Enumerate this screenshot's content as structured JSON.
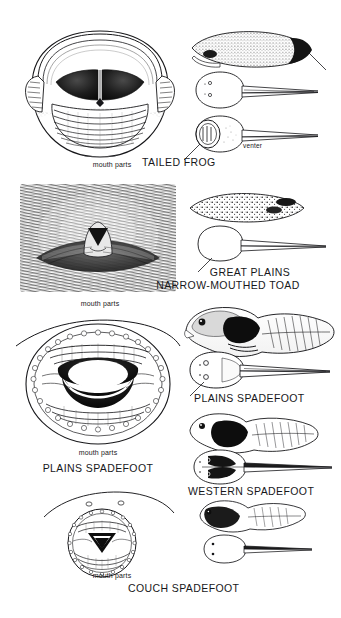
{
  "plate": {
    "kind": "field-guide-illustration-plate",
    "subject": "tadpole mouth parts and body forms",
    "background_color": "#ffffff",
    "ink_color": "#17171a",
    "width": 341,
    "height": 618
  },
  "groups": [
    {
      "id": "tailed-frog",
      "common_name": "TAILED FROG",
      "mouthparts_label": "mouth parts",
      "annotations": [
        "venter"
      ],
      "mouthparts_caption_x": 112,
      "mouthparts_caption_y": 168,
      "name_label_x": 142,
      "name_label_y": 163,
      "views": [
        "lateral",
        "dorsal",
        "ventral"
      ],
      "mouth_description": "very large suctorial oral disc, upper lip hood, two dark jaw sheaths, many transverse tooth rows"
    },
    {
      "id": "great-plains-narrow-mouthed-toad",
      "common_name_line1": "GREAT PLAINS",
      "common_name_line2": "NARROW-MOUTHED TOAD",
      "mouthparts_label": "mouth parts",
      "annotations": [],
      "mouthparts_caption_x": 100,
      "mouthparts_caption_y": 306,
      "name_label_x": 250,
      "name_label_y": 273,
      "views": [
        "lateral",
        "dorsal"
      ],
      "mouth_description": "no oral disc or teeth; small transverse slit mouth in dense stippled field"
    },
    {
      "id": "plains-spadefoot",
      "common_name": "PLAINS SPADEFOOT",
      "mouthparts_label": "mouth parts",
      "annotations": [],
      "mouthparts_caption_x": 98,
      "mouthparts_caption_y": 455,
      "name_label_x": 98,
      "name_label_y": 470,
      "right_name_label": "PLAINS SPADEFOOT",
      "right_name_label_x": 255,
      "right_name_label_y": 399,
      "views": [
        "lateral",
        "dorsal"
      ],
      "mouth_description": "round oral disc ringed by marginal papillae, several tooth rows, large black beak"
    },
    {
      "id": "western-spadefoot",
      "common_name": "WESTERN SPADEFOOT",
      "mouthparts_label": "",
      "annotations": [],
      "name_label_x": 258,
      "name_label_y": 492,
      "views": [
        "lateral",
        "dorsal"
      ],
      "mouth_description": ""
    },
    {
      "id": "couch-spadefoot",
      "common_name": "COUCH SPADEFOOT",
      "mouthparts_label": "mouth parts",
      "annotations": [],
      "mouthparts_caption_x": 112,
      "mouthparts_caption_y": 578,
      "name_label_x": 180,
      "name_label_y": 589,
      "views": [
        "lateral",
        "dorsal"
      ],
      "mouth_description": "small round oral disc, papillary border, tooth rows, dark chevron beak; two nostrils above"
    }
  ]
}
